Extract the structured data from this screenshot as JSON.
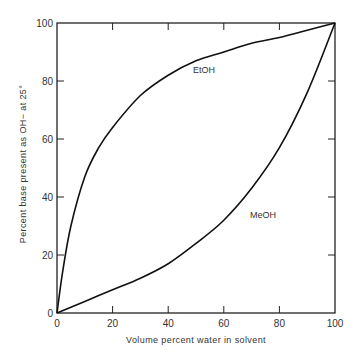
{
  "chart_data": {
    "type": "line",
    "title": "",
    "xlabel": "Volume percent water in solvent",
    "ylabel": "Percent base present as OH− at 25°",
    "xlim": [
      0,
      100
    ],
    "ylim": [
      0,
      100
    ],
    "xticks": [
      0,
      20,
      40,
      60,
      80,
      100
    ],
    "yticks": [
      0,
      20,
      40,
      60,
      80,
      100
    ],
    "grid": false,
    "legend": "inline labels on curves",
    "series": [
      {
        "name": "EtOH",
        "x": [
          0,
          2,
          5,
          10,
          15,
          20,
          30,
          40,
          50,
          60,
          70,
          80,
          90,
          100
        ],
        "values": [
          0,
          14,
          30,
          47,
          57,
          64,
          75,
          82,
          87,
          90,
          93,
          95,
          97.5,
          100
        ]
      },
      {
        "name": "MeOH",
        "x": [
          0,
          10,
          20,
          30,
          40,
          50,
          60,
          70,
          80,
          90,
          100
        ],
        "values": [
          0,
          4,
          8,
          12,
          17,
          24,
          32,
          43,
          57,
          76,
          100
        ]
      }
    ],
    "colors": {
      "line": "#111111",
      "axis": "#222222",
      "text": "#333333"
    }
  }
}
